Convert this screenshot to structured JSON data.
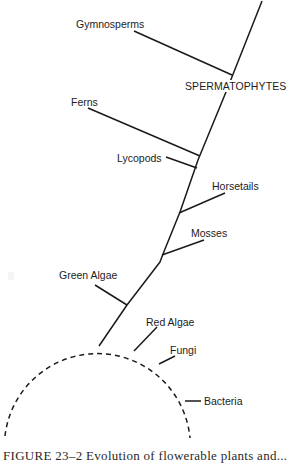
{
  "figure": {
    "stroke_color": "#1a1a1a",
    "main_stem": {
      "points": [
        [
          262,
          1
        ],
        [
          226,
          92
        ],
        [
          198,
          160
        ],
        [
          180,
          212
        ],
        [
          163,
          254
        ],
        [
          160,
          262
        ],
        [
          127,
          305
        ],
        [
          99,
          346
        ]
      ]
    },
    "branches": [
      {
        "name": "gymnosperms",
        "x1": 134,
        "y1": 31,
        "x2": 232,
        "y2": 75
      },
      {
        "name": "ferns",
        "x1": 88,
        "y1": 108,
        "x2": 200,
        "y2": 156
      },
      {
        "name": "lycopods",
        "x1": 166,
        "y1": 157,
        "x2": 197,
        "y2": 168
      },
      {
        "name": "horsetails",
        "x1": 179,
        "y1": 213,
        "x2": 225,
        "y2": 193
      },
      {
        "name": "mosses",
        "x1": 162,
        "y1": 255,
        "x2": 204,
        "y2": 240
      },
      {
        "name": "green-algae",
        "x1": 95,
        "y1": 285,
        "x2": 127,
        "y2": 305
      },
      {
        "name": "red-algae",
        "x1": 134,
        "y1": 351,
        "x2": 157,
        "y2": 327
      },
      {
        "name": "fungi",
        "x1": 159,
        "y1": 364,
        "x2": 175,
        "y2": 356
      },
      {
        "name": "bacteria",
        "x1": 185,
        "y1": 401,
        "x2": 201,
        "y2": 401
      }
    ],
    "origin_arc": {
      "cx": 98,
      "cy": 440,
      "r": 93,
      "dash": "5 4",
      "path": "M 5 436 A 93 93 0 0 1 190 438"
    },
    "labels": {
      "gymnosperms": {
        "text": "Gymnosperms",
        "x": 76,
        "y": 18
      },
      "spermatophytes": {
        "text": "SPERMATOPHYTES",
        "x": 184,
        "y": 80
      },
      "ferns": {
        "text": "Ferns",
        "x": 71,
        "y": 96
      },
      "lycopods": {
        "text": "Lycopods",
        "x": 117,
        "y": 152
      },
      "horsetails": {
        "text": "Horsetails",
        "x": 212,
        "y": 180
      },
      "mosses": {
        "text": "Mosses",
        "x": 191,
        "y": 227
      },
      "green_algae": {
        "text": "Green Algae",
        "x": 59,
        "y": 269
      },
      "red_algae": {
        "text": "Red Algae",
        "x": 146,
        "y": 316
      },
      "fungi": {
        "text": "Fungi",
        "x": 170,
        "y": 344
      },
      "bacteria": {
        "text": "Bacteria",
        "x": 204,
        "y": 395
      }
    },
    "caption": "FIGURE 23–2   Evolution of flowerable plants and..."
  }
}
